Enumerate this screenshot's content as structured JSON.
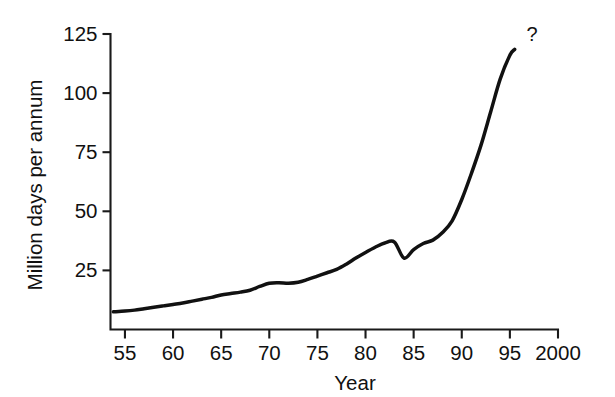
{
  "chart_data": {
    "type": "line",
    "title": "",
    "xlabel": "Year",
    "ylabel": "Million days per annum",
    "xlim": [
      1953.5,
      2000
    ],
    "ylim": [
      0,
      125
    ],
    "grid": false,
    "legend": null,
    "x_tick_labels": [
      "55",
      "60",
      "65",
      "70",
      "75",
      "80",
      "85",
      "90",
      "95",
      "2000"
    ],
    "x_tick_values": [
      1955,
      1960,
      1965,
      1970,
      1975,
      1980,
      1985,
      1990,
      1995,
      2000
    ],
    "y_tick_labels": [
      "25",
      "50",
      "75",
      "100",
      "125"
    ],
    "y_tick_values": [
      25,
      50,
      75,
      100,
      125
    ],
    "annotations": [
      {
        "text": "?",
        "x": 1997.3,
        "y": 122
      }
    ],
    "series": [
      {
        "name": "Million days per annum",
        "color": "#111111",
        "x": [
          1953.8,
          1955,
          1956,
          1957,
          1958,
          1959,
          1960,
          1961,
          1962,
          1963,
          1964,
          1965,
          1966,
          1967,
          1968,
          1969,
          1970,
          1971,
          1972,
          1973,
          1974,
          1975,
          1976,
          1977,
          1978,
          1979,
          1980,
          1981,
          1982,
          1983,
          1984,
          1985,
          1986,
          1987,
          1988,
          1989,
          1990,
          1991,
          1992,
          1993,
          1994,
          1995,
          1995.5
        ],
        "y": [
          7.5,
          7.8,
          8.2,
          8.8,
          9.4,
          10.0,
          10.6,
          11.2,
          12.0,
          12.8,
          13.6,
          14.6,
          15.2,
          15.8,
          16.6,
          18.2,
          19.6,
          19.8,
          19.6,
          20.0,
          21.2,
          22.6,
          24.0,
          25.4,
          27.6,
          30.2,
          32.6,
          34.8,
          36.6,
          37.0,
          30.2,
          33.8,
          36.4,
          37.8,
          41.0,
          46.0,
          55.0,
          66.0,
          78.0,
          92.0,
          106.0,
          116.0,
          118.5
        ]
      }
    ]
  },
  "colors": {
    "ink": "#111111",
    "background": "#ffffff"
  }
}
